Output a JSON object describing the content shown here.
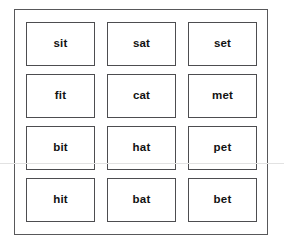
{
  "sheet": {
    "title": "Word Family Cards",
    "background_color": "#ffffff",
    "frame_border_color": "#58585a",
    "card_border_color": "#4d4d50",
    "card_background_color": "#ffffff",
    "text_color": "#121212",
    "artifact_line_color": "#e2e2e2"
  },
  "grid": {
    "columns": 3,
    "rows": 4,
    "cards": [
      {
        "word": "sit"
      },
      {
        "word": "sat"
      },
      {
        "word": "set"
      },
      {
        "word": "fit"
      },
      {
        "word": "cat"
      },
      {
        "word": "met"
      },
      {
        "word": "bit"
      },
      {
        "word": "hat"
      },
      {
        "word": "pet"
      },
      {
        "word": "hit"
      },
      {
        "word": "bat"
      },
      {
        "word": "bet"
      }
    ]
  }
}
